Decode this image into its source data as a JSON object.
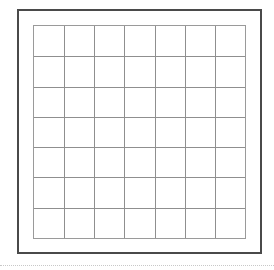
{
  "grid": {
    "columns": 7,
    "rows": 7,
    "line_color": "#8f8f8f",
    "frame_color": "#4a4a4a"
  },
  "footer": {
    "rule_style": "dotted"
  }
}
